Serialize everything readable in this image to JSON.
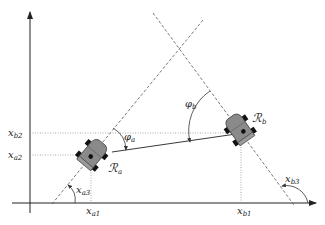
{
  "diagram": {
    "type": "two-robot geometry diagram",
    "colors": {
      "axis": "#222222",
      "dashed": "#555555",
      "dotted": "#888888",
      "robot_body": "#8a8a8a",
      "robot_outline": "#333333",
      "wheel": "#111111"
    },
    "axes": {
      "x_axis_arrow": "right",
      "y_axis_arrow": "up"
    },
    "labels": {
      "xa1": {
        "base": "x",
        "sub": "a1"
      },
      "xa2": {
        "base": "x",
        "sub": "a2"
      },
      "xa3": {
        "base": "x",
        "sub": "a3"
      },
      "xb1": {
        "base": "x",
        "sub": "b1"
      },
      "xb2": {
        "base": "x",
        "sub": "b2"
      },
      "xb3": {
        "base": "x",
        "sub": "b3"
      },
      "phi_a": {
        "base": "φ",
        "sub": "a"
      },
      "phi_b": {
        "base": "φ",
        "sub": "b"
      },
      "robot_a": {
        "base": "ℛ",
        "sub": "a"
      },
      "robot_b": {
        "base": "ℛ",
        "sub": "b"
      }
    },
    "robots": [
      {
        "name": "robot-a",
        "label": "Ra",
        "center": [
          92,
          155
        ],
        "heading_deg": 50
      },
      {
        "name": "robot-b",
        "label": "Rb",
        "center": [
          240,
          130
        ],
        "heading_deg": 126
      }
    ]
  }
}
